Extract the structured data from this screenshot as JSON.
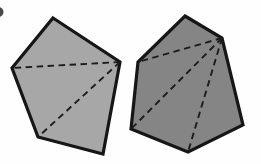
{
  "canvas": {
    "width": 261,
    "height": 164,
    "background": "#fefefe"
  },
  "style": {
    "outline_color": "#161616",
    "outline_width": 3.2,
    "diagonal_color": "#1c1c1c",
    "diagonal_width": 1.9,
    "diagonal_dash": "6.5 4.5"
  },
  "label_fragment": {
    "cx": -1.5,
    "cy": 12,
    "r": 5,
    "fill": "#4a4a4a"
  },
  "polygons": [
    {
      "name": "pentagon-left",
      "sides": 5,
      "fill": "#a7a7a7",
      "vertices": [
        [
          53,
          18
        ],
        [
          120,
          62
        ],
        [
          103,
          154
        ],
        [
          38,
          137
        ],
        [
          12,
          68
        ]
      ],
      "diagonals": [
        [
          1,
          4
        ],
        [
          1,
          3
        ]
      ]
    },
    {
      "name": "hexagon-right",
      "sides": 6,
      "fill": "#858585",
      "vertices": [
        [
          185,
          16
        ],
        [
          222,
          38
        ],
        [
          243,
          125
        ],
        [
          188,
          152
        ],
        [
          131,
          129
        ],
        [
          138,
          62
        ]
      ],
      "diagonals": [
        [
          1,
          5
        ],
        [
          1,
          4
        ],
        [
          1,
          3
        ]
      ]
    }
  ]
}
